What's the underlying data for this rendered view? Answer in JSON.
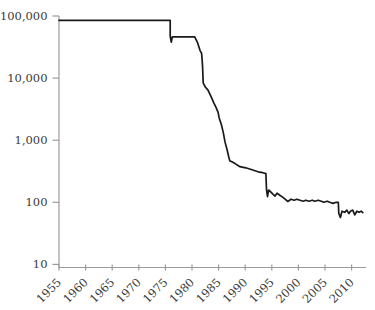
{
  "figure": {
    "background": "#ffffff",
    "line_color": "#1a1a1a",
    "axis_color": "#9b9b9b",
    "label_color": "#3a3a3a"
  },
  "chart_data": {
    "type": "line",
    "title": "",
    "xlabel": "",
    "ylabel": "",
    "grid": "off",
    "legend": "none",
    "x_axis": {
      "ticks": [
        1955,
        1960,
        1965,
        1970,
        1975,
        1980,
        1985,
        1990,
        1995,
        2000,
        2005,
        2010
      ],
      "tick_labels": [
        "1955",
        "1960",
        "1965",
        "1970",
        "1975",
        "1980",
        "1985",
        "1990",
        "1995",
        "2000",
        "2005",
        "2010"
      ],
      "range": [
        1955,
        2013
      ],
      "tick_rotation_deg": 45
    },
    "y_axis": {
      "scale": "log",
      "ticks": [
        100000,
        10000,
        1000,
        100,
        10
      ],
      "tick_labels": [
        "100,000",
        "10,000",
        "1,000",
        "100",
        "10"
      ],
      "range": [
        10,
        100000
      ]
    },
    "series": [
      {
        "name": "series-1",
        "color": "#1a1a1a",
        "points": [
          [
            1955.0,
            85000
          ],
          [
            1975.9,
            85000
          ],
          [
            1975.9,
            47000
          ],
          [
            1976.1,
            38000
          ],
          [
            1976.3,
            46000
          ],
          [
            1980.5,
            46000
          ],
          [
            1981.0,
            38000
          ],
          [
            1981.5,
            28000
          ],
          [
            1981.8,
            25000
          ],
          [
            1981.9,
            20000
          ],
          [
            1982.0,
            15000
          ],
          [
            1982.1,
            8400
          ],
          [
            1982.5,
            7200
          ],
          [
            1983.0,
            6400
          ],
          [
            1983.6,
            5000
          ],
          [
            1984.1,
            4000
          ],
          [
            1984.5,
            3400
          ],
          [
            1984.9,
            2800
          ],
          [
            1985.1,
            2300
          ],
          [
            1985.5,
            1800
          ],
          [
            1985.9,
            1300
          ],
          [
            1986.2,
            940
          ],
          [
            1986.6,
            700
          ],
          [
            1986.9,
            540
          ],
          [
            1987.1,
            465
          ],
          [
            1987.5,
            450
          ],
          [
            1988.1,
            420
          ],
          [
            1989.0,
            375
          ],
          [
            1990.1,
            360
          ],
          [
            1991.3,
            335
          ],
          [
            1992.4,
            310
          ],
          [
            1993.3,
            300
          ],
          [
            1993.9,
            290
          ],
          [
            1994.0,
            160
          ],
          [
            1994.2,
            123
          ],
          [
            1994.4,
            158
          ],
          [
            1994.8,
            147
          ],
          [
            1995.2,
            135
          ],
          [
            1995.6,
            126
          ],
          [
            1996.0,
            140
          ],
          [
            1996.5,
            130
          ],
          [
            1997.1,
            120
          ],
          [
            1997.5,
            112
          ],
          [
            1998.0,
            103
          ],
          [
            1998.6,
            112
          ],
          [
            1999.2,
            108
          ],
          [
            1999.7,
            112
          ],
          [
            2000.3,
            108
          ],
          [
            2000.9,
            104
          ],
          [
            2001.4,
            108
          ],
          [
            2002.0,
            104
          ],
          [
            2002.6,
            108
          ],
          [
            2003.1,
            104
          ],
          [
            2003.7,
            108
          ],
          [
            2004.3,
            104
          ],
          [
            2004.8,
            100
          ],
          [
            2005.4,
            104
          ],
          [
            2005.9,
            100
          ],
          [
            2006.5,
            96
          ],
          [
            2007.1,
            100
          ],
          [
            2007.5,
            100
          ],
          [
            2007.6,
            66
          ],
          [
            2007.9,
            57
          ],
          [
            2008.2,
            72
          ],
          [
            2008.7,
            69
          ],
          [
            2009.1,
            75
          ],
          [
            2009.5,
            66
          ],
          [
            2009.8,
            72
          ],
          [
            2010.2,
            75
          ],
          [
            2010.6,
            63
          ],
          [
            2011.0,
            72
          ],
          [
            2011.4,
            69
          ],
          [
            2011.8,
            72
          ],
          [
            2012.1,
            68
          ]
        ]
      }
    ]
  }
}
